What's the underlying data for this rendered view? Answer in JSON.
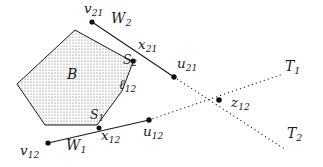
{
  "figure": {
    "type": "geometric-diagram",
    "caption_absent": true,
    "background_color": "#ffffff",
    "stroke_color": "#1a1a1a",
    "fill_pattern": "stipple-dots",
    "fill_color": "#6a6a6a"
  },
  "labels": {
    "region_b": "B",
    "vertex_v21": "v",
    "vertex_v21_sub": "21",
    "vertex_v12": "v",
    "vertex_v12_sub": "12",
    "point_x21": "x",
    "point_x21_sub": "21",
    "point_x12": "x",
    "point_x12_sub": "12",
    "point_u21": "u",
    "point_u21_sub": "21",
    "point_u12": "u",
    "point_u12_sub": "12",
    "point_z12": "z",
    "point_z12_sub": "12",
    "segment_w1": "W",
    "segment_w1_sub": "1",
    "segment_w2": "W",
    "segment_w2_sub": "2",
    "side_s1": "S",
    "side_s1_sub": "1",
    "side_s2": "S",
    "side_s2_sub": "2",
    "edge_l12": "ℓ",
    "edge_l12_sub": "12",
    "ray_t1": "T",
    "ray_t1_sub": "1",
    "ray_t2": "T",
    "ray_t2_sub": "2"
  },
  "geometry": {
    "polygon_b": [
      [
        17,
        84
      ],
      [
        75,
        30
      ],
      [
        133,
        62
      ],
      [
        122,
        91
      ],
      [
        97,
        125
      ],
      [
        45,
        125
      ]
    ],
    "points": {
      "v21": [
        92,
        22
      ],
      "x21": [
        133,
        61
      ],
      "u21": [
        174,
        77
      ],
      "v12": [
        48,
        143
      ],
      "x12": [
        99,
        128
      ],
      "u12": [
        149,
        120
      ],
      "z12": [
        219,
        100
      ]
    },
    "solid_lines": [
      {
        "name": "w2-line",
        "from": [
          92,
          22
        ],
        "to": [
          174,
          77
        ]
      },
      {
        "name": "w1-line",
        "from": [
          48,
          143
        ],
        "to": [
          149,
          120
        ]
      }
    ],
    "dotted_lines": [
      {
        "name": "u21-to-t2",
        "from": [
          174,
          77
        ],
        "to": [
          286,
          150
        ]
      },
      {
        "name": "u12-to-t1",
        "from": [
          149,
          120
        ],
        "to": [
          283,
          74
        ]
      }
    ],
    "label_positions": {
      "region_b": [
        67,
        67
      ],
      "v21": [
        84,
        2
      ],
      "v12": [
        20,
        144
      ],
      "x21": [
        137,
        38
      ],
      "x12": [
        100,
        129
      ],
      "u21": [
        175,
        58
      ],
      "u12": [
        142,
        125
      ],
      "z12": [
        231,
        96
      ],
      "w1": [
        66,
        139
      ],
      "w2": [
        111,
        12
      ],
      "s1": [
        90,
        109
      ],
      "s2": [
        123,
        55
      ],
      "l12": [
        119,
        78
      ],
      "t1": [
        284,
        60
      ],
      "t2": [
        286,
        126
      ]
    }
  }
}
